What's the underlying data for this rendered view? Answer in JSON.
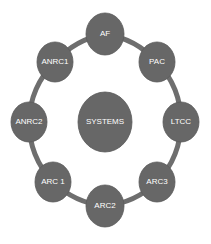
{
  "diagram": {
    "type": "hub-and-ring",
    "colors": {
      "node_fill": "#676767",
      "node_stroke": "#5a5a5a",
      "connector": "#6e6e6e",
      "label": "#ffffff",
      "background": "#ffffff"
    },
    "center": {
      "id": "systems",
      "label": "SYSTEMS",
      "cx": 105,
      "cy": 122,
      "rx": 27,
      "ry": 30
    },
    "ring": {
      "cx": 105,
      "cy": 122,
      "r": 88,
      "nodes": [
        {
          "id": "af",
          "label": "AF",
          "cx": 105,
          "cy": 34,
          "rx": 19,
          "ry": 21
        },
        {
          "id": "pac",
          "label": "PAC",
          "cx": 157,
          "cy": 62,
          "rx": 18,
          "ry": 20
        },
        {
          "id": "ltcc",
          "label": "LTCC",
          "cx": 181,
          "cy": 122,
          "rx": 18,
          "ry": 20
        },
        {
          "id": "arc3",
          "label": "ARC3",
          "cx": 157,
          "cy": 182,
          "rx": 18,
          "ry": 20
        },
        {
          "id": "arc2",
          "label": "ARC2",
          "cx": 105,
          "cy": 206,
          "rx": 19,
          "ry": 21
        },
        {
          "id": "arc1",
          "label": "ARC 1",
          "cx": 53,
          "cy": 182,
          "rx": 18,
          "ry": 20
        },
        {
          "id": "anrc2",
          "label": "ANRC2",
          "cx": 29,
          "cy": 122,
          "rx": 18,
          "ry": 20
        },
        {
          "id": "anrc1",
          "label": "ANRC1",
          "cx": 55,
          "cy": 62,
          "rx": 18,
          "ry": 20
        }
      ]
    }
  }
}
